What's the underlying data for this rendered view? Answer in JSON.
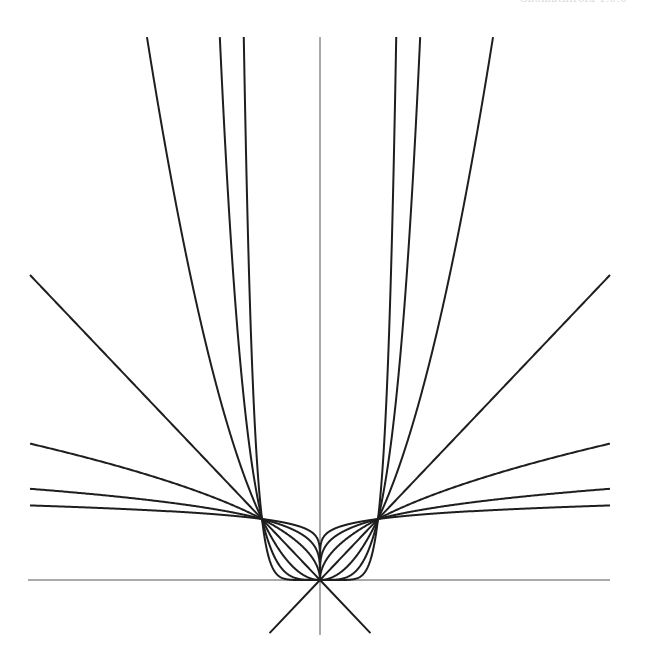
{
  "header": {
    "text": "Ghomathirolu 1.0.0"
  },
  "chart_data": {
    "type": "line",
    "title": "",
    "xlabel": "",
    "ylabel": "",
    "xlim": [
      -5,
      5
    ],
    "ylim": [
      -0.9,
      8.9
    ],
    "grid": false,
    "legend": null,
    "axes": {
      "x_axis_through_origin": true,
      "y_axis_through_origin": true
    },
    "series": [
      {
        "name": "y = |x|^(1/8)",
        "exponent": 0.125,
        "values_at": {
          "x": [
            -5,
            -1,
            0,
            1,
            5
          ],
          "y": [
            1.223,
            1,
            0,
            1,
            1.223
          ]
        }
      },
      {
        "name": "y = |x|^(1/4)",
        "exponent": 0.25,
        "values_at": {
          "x": [
            -5,
            -1,
            0,
            1,
            5
          ],
          "y": [
            1.495,
            1,
            0,
            1,
            1.495
          ]
        }
      },
      {
        "name": "y = |x|^(1/2)",
        "exponent": 0.5,
        "values_at": {
          "x": [
            -5,
            -1,
            0,
            1,
            5
          ],
          "y": [
            2.236,
            1,
            0,
            1,
            2.236
          ]
        }
      },
      {
        "name": "y = |x|",
        "exponent": 1,
        "values_at": {
          "x": [
            -5,
            -1,
            0,
            1,
            5
          ],
          "y": [
            5,
            1,
            0,
            1,
            5
          ]
        }
      },
      {
        "name": "y = x^2",
        "exponent": 2,
        "values_at": {
          "x": [
            -2.98,
            -1,
            0,
            1,
            2.98
          ],
          "y": [
            8.9,
            1,
            0,
            1,
            8.9
          ]
        }
      },
      {
        "name": "y = x^4",
        "exponent": 4,
        "values_at": {
          "x": [
            -1.73,
            -1,
            0,
            1,
            1.73
          ],
          "y": [
            8.9,
            1,
            0,
            1,
            8.9
          ]
        }
      },
      {
        "name": "y = x^8",
        "exponent": 8,
        "values_at": {
          "x": [
            -1.31,
            -1,
            0,
            1,
            1.31
          ],
          "y": [
            8.9,
            1,
            0,
            1,
            8.9
          ]
        }
      },
      {
        "name": "y = -|x| (lower branches)",
        "exponent": "line",
        "values_at": {
          "x": [
            -0.87,
            0,
            0.87
          ],
          "y": [
            -0.87,
            0,
            -0.87
          ]
        }
      }
    ],
    "common_points": [
      [
        -1,
        1
      ],
      [
        0,
        0
      ],
      [
        1,
        1
      ]
    ]
  },
  "style": {
    "curve_color": "#1e1e1e",
    "axis_color": "#555555",
    "background": "#ffffff"
  },
  "layout": {
    "origin_px": [
      320,
      580
    ],
    "unit_x_px": 58,
    "unit_y_px": 61
  }
}
